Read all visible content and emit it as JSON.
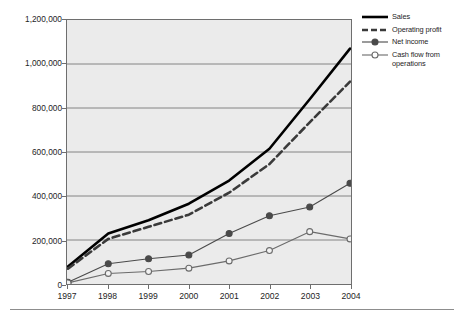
{
  "chart_data": {
    "type": "line",
    "title": "",
    "subtitle": "",
    "xlabel": "",
    "ylabel": "",
    "categories": [
      "1997",
      "1998",
      "1999",
      "2000",
      "2001",
      "2002",
      "2003",
      "2004"
    ],
    "x": [
      1997,
      1998,
      1999,
      2000,
      2001,
      2002,
      2003,
      2004
    ],
    "ylim": [
      0,
      1200000
    ],
    "xlim": [
      1997,
      2004
    ],
    "yticks": [
      0,
      200000,
      400000,
      600000,
      800000,
      1000000,
      1200000
    ],
    "ytick_labels": [
      "0",
      "200,000",
      "400,000",
      "600,000",
      "800,000",
      "1,000,000",
      "1,200,000"
    ],
    "xtick_labels": [
      "1997",
      "1998",
      "1999",
      "2000",
      "2001",
      "2002",
      "2003",
      "2004"
    ],
    "grid": "horizontal",
    "legend_position": "right",
    "series": [
      {
        "name": "Sales",
        "style": "solid-thick",
        "marker": "none",
        "color": "#000000",
        "values": [
          80000,
          230000,
          290000,
          365000,
          470000,
          615000,
          840000,
          1070000
        ]
      },
      {
        "name": "Operating profit",
        "style": "dashed-thick",
        "marker": "none",
        "color": "#3a3a3a",
        "values": [
          70000,
          205000,
          260000,
          315000,
          415000,
          545000,
          735000,
          920000
        ]
      },
      {
        "name": "Net income",
        "style": "solid-thin",
        "marker": "filled-circle",
        "color": "#4a4a4a",
        "values": [
          8000,
          92000,
          115000,
          132000,
          230000,
          310000,
          350000,
          458000
        ]
      },
      {
        "name": "Cash flow from operations",
        "style": "solid-thin",
        "marker": "open-circle",
        "color": "#6b6b6b",
        "values": [
          5000,
          48000,
          57000,
          72000,
          105000,
          152000,
          238000,
          205000
        ]
      }
    ]
  },
  "legend": {
    "items": [
      {
        "label": "Sales",
        "key": "line-solid-thick-key"
      },
      {
        "label": "Operating profit",
        "key": "line-dashed-thick-key"
      },
      {
        "label": "Net income",
        "key": "line-filled-marker-key"
      },
      {
        "label": "Cash flow from operations",
        "key": "line-open-marker-key"
      }
    ]
  },
  "colors": {
    "plot_background": "#ebebeb",
    "grid": "#777777",
    "axis": "#6e6e6e",
    "text": "#1e1e1e",
    "footer_rule": "#8d8d8d"
  }
}
